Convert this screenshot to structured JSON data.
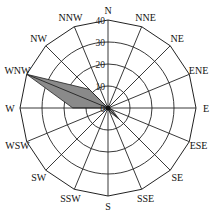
{
  "chart_data": {
    "type": "radar",
    "subtype": "wind-rose",
    "directions": [
      "N",
      "NNE",
      "NE",
      "ENE",
      "E",
      "ESE",
      "SE",
      "SSE",
      "S",
      "SSW",
      "SW",
      "WSW",
      "W",
      "WNW",
      "NW",
      "NNW"
    ],
    "series": [
      {
        "name": "frequency",
        "values": [
          0,
          0,
          0,
          0,
          0,
          2,
          7,
          2,
          0,
          0,
          0,
          0,
          16,
          40,
          12,
          0
        ],
        "fill": "#8a8a8a",
        "stroke": "#222222"
      }
    ],
    "radial_ticks": [
      0,
      10,
      20,
      30,
      40
    ],
    "rlim": [
      0,
      40
    ],
    "grid": true,
    "title": "",
    "caption": ""
  },
  "colors": {
    "grid": "#222222",
    "fill": "#8a8a8a",
    "background": "#ffffff"
  }
}
